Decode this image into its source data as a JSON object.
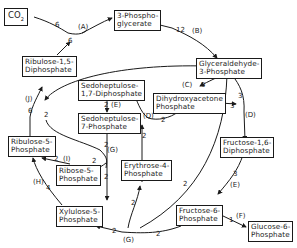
{
  "diagram": {
    "colors": {
      "line": "#1a1a1a",
      "background": "#ffffff"
    },
    "nodes": {
      "co2": {
        "label": "CO",
        "sub": "2"
      },
      "pga": {
        "line1": "3-Phospho-",
        "line2": "glycerate"
      },
      "rubp": {
        "line1": "Ribulose-1,5-",
        "line2": "Diphosphate"
      },
      "g3p": {
        "line1": "Glyceraldehyde-",
        "line2": "3-Phosphate"
      },
      "dhap": {
        "line1": "Dihydroxyacetone",
        "line2": "Phosphate"
      },
      "sbp": {
        "line1": "Sedoheptulose-",
        "line2": "1,7-Diphosphate"
      },
      "s7p": {
        "line1": "Sedoheptulose-",
        "line2": "7-Phosphate"
      },
      "fbp": {
        "line1": "Fructose-1,6-",
        "line2": "Diphosphate"
      },
      "ru5p": {
        "line1": "Ribulose-5-",
        "line2": "Phosphate"
      },
      "r5p": {
        "line1": "Ribose-5-",
        "line2": "Phosphate"
      },
      "e4p": {
        "line1": "Erythrose-4-",
        "line2": "Phosphate"
      },
      "x5p": {
        "line1": "Xylulose-5-",
        "line2": "Phosphate"
      },
      "f6p": {
        "line1": "Fructose-6-",
        "line2": "Phosphate"
      },
      "g6p": {
        "line1": "Glucose-6-",
        "line2": "Phosphate"
      }
    },
    "reactions": {
      "A": "(A)",
      "B": "(B)",
      "C": "(C)",
      "D1": "(D)",
      "D2": "(D)",
      "E1": "(E)",
      "E2": "(E)",
      "F": "(F)",
      "G1": "(G)",
      "G2": "(G)",
      "H": "(H)",
      "I": "(I)",
      "J": "(J)"
    },
    "stoichiometry": {
      "co2_in": "6",
      "rubp_out": "6",
      "pga_out": "12",
      "g3p_to_dhap": "5",
      "g3p_to_fbp": "3",
      "dhap_to_fbp": "3",
      "dhap_to_sbp": "2",
      "fbp_to_f6p": "3",
      "sbp_to_s7p": "2",
      "s7p_g": "2",
      "s7p_to_x5p": "2",
      "to_r5p": "2",
      "r5p_to_ru5p": "2",
      "x5p_to_ru5p": "4",
      "ru5p_to_rubp": "6",
      "g3p_to_sbp": "2",
      "f6p_to_x5p": "2",
      "f6p_to_e4p": "2",
      "e4p_to_sbp": "2",
      "f6p_to_g6p": "1",
      "f6p_g": "2",
      "g3p_loop": "2"
    }
  }
}
